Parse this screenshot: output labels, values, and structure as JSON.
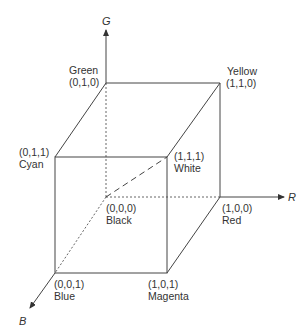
{
  "axes": {
    "r": {
      "label": "R"
    },
    "g": {
      "label": "G"
    },
    "b": {
      "label": "B"
    }
  },
  "vertices": {
    "black": {
      "name": "Black",
      "coords": "(0,0,0)",
      "label_first": "coords"
    },
    "red": {
      "name": "Red",
      "coords": "(1,0,0)",
      "label_first": "coords"
    },
    "green": {
      "name": "Green",
      "coords": "(0,1,0)",
      "label_first": "name"
    },
    "blue": {
      "name": "Blue",
      "coords": "(0,0,1)",
      "label_first": "coords"
    },
    "yellow": {
      "name": "Yellow",
      "coords": "(1,1,0)",
      "label_first": "name"
    },
    "cyan": {
      "name": "Cyan",
      "coords": "(0,1,1)",
      "label_first": "coords"
    },
    "magenta": {
      "name": "Magenta",
      "coords": "(1,0,1)",
      "label_first": "coords"
    },
    "white": {
      "name": "White",
      "coords": "(1,1,1)",
      "label_first": "coords"
    }
  }
}
